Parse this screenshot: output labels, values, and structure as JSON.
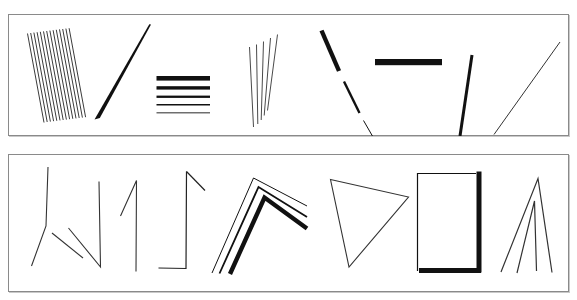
{
  "figure": {
    "background_color": "#ffffff",
    "ink_color": "#111111",
    "border_color": "#8a8a8a",
    "shadow_color": "#c9c9c9",
    "width": 577,
    "height": 300
  },
  "panels": [
    {
      "id": "panel-top",
      "label": "Top panel",
      "x": 8,
      "y": 14,
      "width": 561,
      "height": 122,
      "items": [
        {
          "name": "hatched-parallelogram",
          "label": "Dense hatched parallelogram",
          "kind": "hatch-bundle",
          "line_count": 14,
          "stroke_width": 0.9,
          "color": "#222222"
        },
        {
          "name": "tapered-diagonal-wedge",
          "label": "Tapered diagonal wedge",
          "kind": "wedge",
          "thick_end": 5.0,
          "thin_end": 0.6,
          "color": "#111111"
        },
        {
          "name": "horizontal-bar-stack",
          "label": "Stack of five horizontal bars, decreasing thickness",
          "kind": "bar-stack",
          "bar_count": 5,
          "thicknesses": [
            4.6,
            3.4,
            2.3,
            1.5,
            0.9
          ],
          "color": "#111111"
        },
        {
          "name": "vertical-line-fan",
          "label": "Fan of five near-vertical thin lines",
          "kind": "line-fan",
          "line_count": 5,
          "stroke_width": 1.0,
          "color": "#444444"
        },
        {
          "name": "dashed-diagonal-descending",
          "label": "Dashed diagonal, three segments of decreasing thickness",
          "kind": "dashed-diagonal",
          "segment_count": 3,
          "thicknesses": [
            4.4,
            2.4,
            1.0
          ],
          "color": "#111111"
        },
        {
          "name": "thick-horizontal-bar",
          "label": "Single thick horizontal bar",
          "kind": "bar",
          "stroke_width": 6.0,
          "color": "#111111"
        },
        {
          "name": "thick-diagonal-left",
          "label": "Thick diagonal leaning left",
          "kind": "line",
          "stroke_width": 3.0,
          "color": "#111111"
        },
        {
          "name": "thin-diagonal-right",
          "label": "Thin diagonal leaning right",
          "kind": "line",
          "stroke_width": 1.0,
          "color": "#333333"
        }
      ]
    },
    {
      "id": "panel-bottom",
      "label": "Bottom panel",
      "x": 8,
      "y": 154,
      "width": 561,
      "height": 138,
      "items": [
        {
          "name": "bent-line-obtuse",
          "label": "Bent line with obtuse vertex",
          "kind": "polyline",
          "stroke_width": 1.1,
          "color": "#333333"
        },
        {
          "name": "v-shape-open",
          "label": "Open V shape, vertical right arm",
          "kind": "polyline",
          "stroke_width": 1.1,
          "color": "#333333"
        },
        {
          "name": "numeral-one-shape",
          "label": "Numeral-one shape with flag",
          "kind": "polyline",
          "stroke_width": 1.1,
          "color": "#333333"
        },
        {
          "name": "j-hook-shape",
          "label": "J hook with top flag",
          "kind": "polyline",
          "stroke_width": 1.2,
          "color": "#222222"
        },
        {
          "name": "nested-chevrons",
          "label": "Three nested chevrons of increasing thickness",
          "kind": "chevron-nest",
          "chevron_count": 3,
          "thicknesses": [
            1.0,
            1.8,
            4.4
          ],
          "color": "#111111"
        },
        {
          "name": "thin-triangle",
          "label": "Thin open triangle",
          "kind": "polygon",
          "stroke_width": 1.1,
          "color": "#333333"
        },
        {
          "name": "rectangle-mixed-weight",
          "label": "Rectangle with thin top-left and thick bottom-right sides",
          "kind": "rect-outline",
          "thin_stroke": 1.2,
          "thick_stroke": 5.0,
          "color": "#111111"
        },
        {
          "name": "triple-peak-lines",
          "label": "Three converging peak lines",
          "kind": "peak-lines",
          "line_count": 3,
          "stroke_width": 1.2,
          "color": "#333333"
        }
      ]
    }
  ]
}
